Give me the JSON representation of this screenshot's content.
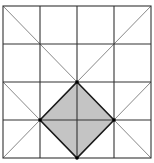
{
  "diagram": {
    "grid": {
      "rows": 4,
      "cols": 4,
      "x_lines": [
        3,
        40,
        77,
        114,
        151
      ],
      "y_lines": [
        6,
        44,
        82,
        120,
        158
      ],
      "line_color": "#333333"
    },
    "diagonal_color": "#7a7a7a",
    "shaded_square": {
      "vertices": [
        [
          77,
          82
        ],
        [
          114,
          120
        ],
        [
          77,
          158
        ],
        [
          40,
          120
        ]
      ],
      "fill": "#c4c4c4",
      "stroke": "#1a1a1a"
    },
    "marked_points": [
      [
        77,
        82
      ],
      [
        40,
        120
      ],
      [
        114,
        120
      ],
      [
        77,
        158
      ]
    ]
  }
}
